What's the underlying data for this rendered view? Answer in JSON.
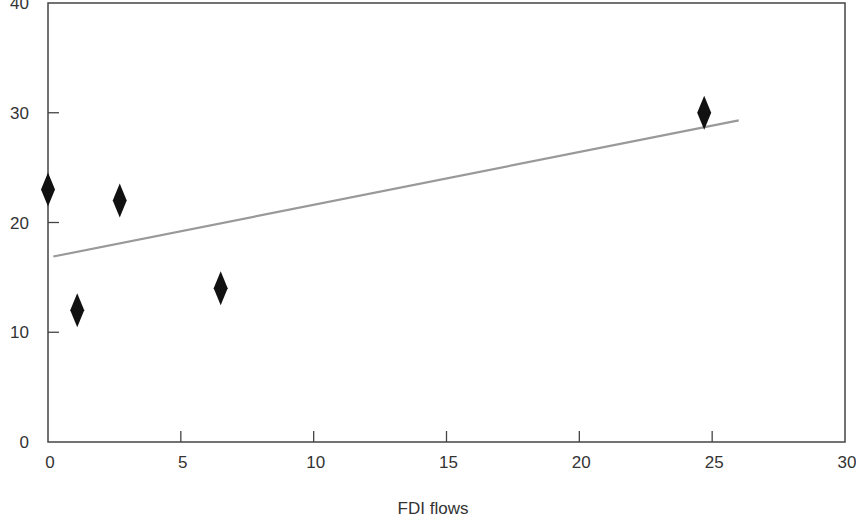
{
  "chart_data": {
    "type": "scatter",
    "title": "",
    "xlabel": "FDI flows",
    "ylabel": "",
    "xlim": [
      0,
      30
    ],
    "ylim": [
      0,
      40
    ],
    "x_ticks": [
      0,
      5,
      10,
      15,
      20,
      25,
      30
    ],
    "y_ticks": [
      0,
      10,
      20,
      30,
      40
    ],
    "grid": false,
    "legend": null,
    "series": [
      {
        "name": "observations",
        "marker": "diamond",
        "color": "#111111",
        "points": [
          {
            "x": 0.0,
            "y": 23
          },
          {
            "x": 1.1,
            "y": 12
          },
          {
            "x": 2.7,
            "y": 22
          },
          {
            "x": 6.5,
            "y": 14
          },
          {
            "x": 24.7,
            "y": 30
          }
        ]
      },
      {
        "name": "linear trend",
        "type": "line",
        "color": "#999999",
        "points": [
          {
            "x": 0.2,
            "y": 16.9
          },
          {
            "x": 26.0,
            "y": 29.3
          }
        ]
      }
    ]
  },
  "axes": {
    "x_title": "FDI flows"
  }
}
